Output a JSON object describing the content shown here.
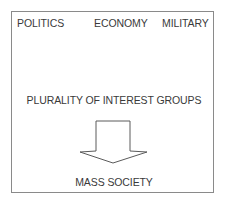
{
  "diagram": {
    "top_labels": [
      {
        "label": "POLITICS"
      },
      {
        "label": "ECONOMY"
      },
      {
        "label": "MILITARY"
      }
    ],
    "middle_label": "PLURALITY OF INTEREST GROUPS",
    "arrow": {
      "direction": "down",
      "icon": "hollow-down-arrow-icon"
    },
    "bottom_label": "MASS SOCIETY",
    "colors": {
      "border": "#8a8a8a",
      "text": "#3a3a3a",
      "arrow_stroke": "#5a5a5a",
      "background": "#ffffff"
    }
  }
}
